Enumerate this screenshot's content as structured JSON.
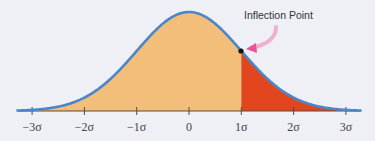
{
  "chart_data": {
    "type": "area",
    "title": "",
    "xlabel": "",
    "ylabel": "",
    "distribution": "standard normal",
    "x_range": [
      -3.3,
      3.3
    ],
    "ticks": [
      -3,
      -2,
      -1,
      0,
      1,
      2,
      3
    ],
    "tick_labels": [
      "−3σ",
      "−2σ",
      "−1σ",
      "0",
      "1σ",
      "2σ",
      "3σ"
    ],
    "regions": [
      {
        "name": "body",
        "from": -3.3,
        "to": 1,
        "color": "#f3bd7a"
      },
      {
        "name": "upper tail",
        "from": 1,
        "to": 3.3,
        "color": "#e2461f"
      }
    ],
    "curve_color": "#4a86c8",
    "annotations": [
      {
        "text": "Inflection Point",
        "x": 1,
        "y": "pdf(1)",
        "arrow_color": "#e8529a",
        "marker": "black dot"
      }
    ],
    "grid": false,
    "legend": null
  },
  "labels": {
    "annotation": "Inflection Point",
    "ticks": [
      "−3σ",
      "−2σ",
      "−1σ",
      "0",
      "1σ",
      "2σ",
      "3σ"
    ]
  }
}
